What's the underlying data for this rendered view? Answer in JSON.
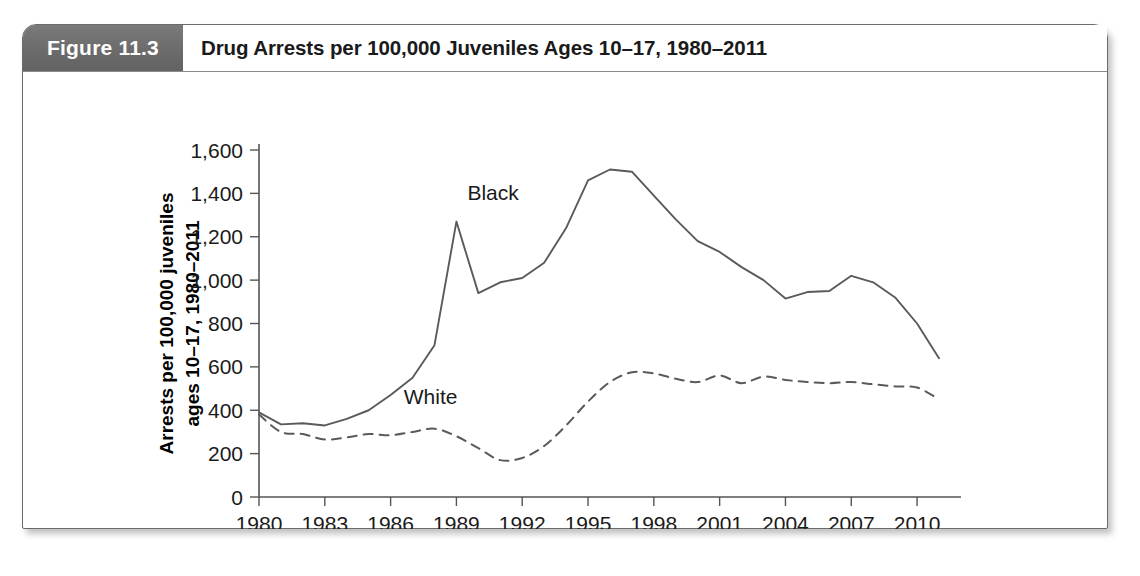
{
  "figure": {
    "tag_label": "Figure 11.3",
    "title": "Drug Arrests per 100,000 Juveniles Ages 10–17, 1980–2011"
  },
  "colors": {
    "tag_background": "#6e6e6e",
    "tag_text": "#ffffff",
    "title_text": "#1a1a1a",
    "frame_border": "#6b6b6b",
    "axis": "#555555",
    "series_line": "#5a5a5a",
    "page_background": "#ffffff"
  },
  "chart_data": {
    "type": "line",
    "title": "Drug Arrests per 100,000 Juveniles Ages 10–17, 1980–2011",
    "xlabel": "",
    "ylabel": "Arrests per 100,000 juveniles ages 10–17, 1980–2011",
    "ylabel_line1": "Arrests per 100,000 juveniles",
    "ylabel_line2": "ages 10–17, 1980–2011",
    "xlim": [
      1980,
      2011
    ],
    "ylim": [
      0,
      1600
    ],
    "ytick_values": [
      0,
      200,
      400,
      600,
      800,
      1000,
      1200,
      1400,
      1600
    ],
    "ytick_labels": [
      "0",
      "200",
      "400",
      "600",
      "800",
      "1,000",
      "1,200",
      "1,400",
      "1,600"
    ],
    "xtick_values": [
      1980,
      1983,
      1986,
      1989,
      1992,
      1995,
      1998,
      2001,
      2004,
      2007,
      2010
    ],
    "xtick_labels": [
      "1980",
      "1983",
      "1986",
      "1989",
      "1992",
      "1995",
      "1998",
      "2001",
      "2004",
      "2007",
      "2010"
    ],
    "grid": false,
    "legend": "inline-labels",
    "x": [
      1980,
      1981,
      1982,
      1983,
      1984,
      1985,
      1986,
      1987,
      1988,
      1989,
      1990,
      1991,
      1992,
      1993,
      1994,
      1995,
      1996,
      1997,
      1998,
      1999,
      2000,
      2001,
      2002,
      2003,
      2004,
      2005,
      2006,
      2007,
      2008,
      2009,
      2010,
      2011
    ],
    "series": [
      {
        "name": "Black",
        "label": "Black",
        "style": "solid",
        "values": [
          390,
          335,
          340,
          330,
          360,
          400,
          470,
          550,
          700,
          1270,
          940,
          990,
          1010,
          1080,
          1240,
          1460,
          1510,
          1500,
          1390,
          1280,
          1180,
          1130,
          1060,
          1000,
          915,
          945,
          950,
          1020,
          990,
          920,
          800,
          640
        ]
      },
      {
        "name": "White",
        "label": "White",
        "style": "dashed",
        "values": [
          380,
          300,
          290,
          265,
          275,
          290,
          285,
          300,
          315,
          280,
          225,
          170,
          180,
          235,
          330,
          440,
          530,
          575,
          570,
          545,
          530,
          560,
          525,
          555,
          540,
          530,
          525,
          530,
          520,
          510,
          505,
          450
        ]
      }
    ],
    "annotations": [
      {
        "text": "Black",
        "x": 1989.5,
        "y": 1370
      },
      {
        "text": "White",
        "x": 1986.6,
        "y": 430
      }
    ]
  }
}
